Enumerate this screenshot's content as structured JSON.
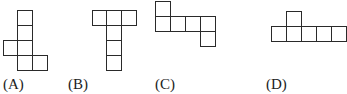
{
  "cell_size": 15,
  "line_color": "#2a2a2a",
  "options": [
    {
      "id": "A",
      "label": "(A)",
      "label_x": 3,
      "cells": [
        [
          17,
          10
        ],
        [
          17,
          25
        ],
        [
          3,
          40
        ],
        [
          17,
          40
        ],
        [
          17,
          55
        ],
        [
          32,
          55
        ]
      ]
    },
    {
      "id": "B",
      "label": "(B)",
      "label_x": 68,
      "cells": [
        [
          92,
          10
        ],
        [
          106,
          10
        ],
        [
          121,
          10
        ],
        [
          106,
          25
        ],
        [
          106,
          40
        ],
        [
          106,
          55
        ]
      ]
    },
    {
      "id": "C",
      "label": "(C)",
      "label_x": 155,
      "cells": [
        [
          155,
          1
        ],
        [
          155,
          16
        ],
        [
          170,
          16
        ],
        [
          185,
          16
        ],
        [
          200,
          16
        ],
        [
          200,
          31
        ]
      ]
    },
    {
      "id": "D",
      "label": "(D)",
      "label_x": 266,
      "cells": [
        [
          286,
          11
        ],
        [
          271,
          26
        ],
        [
          286,
          26
        ],
        [
          301,
          26
        ],
        [
          316,
          26
        ],
        [
          331,
          26
        ]
      ]
    }
  ]
}
